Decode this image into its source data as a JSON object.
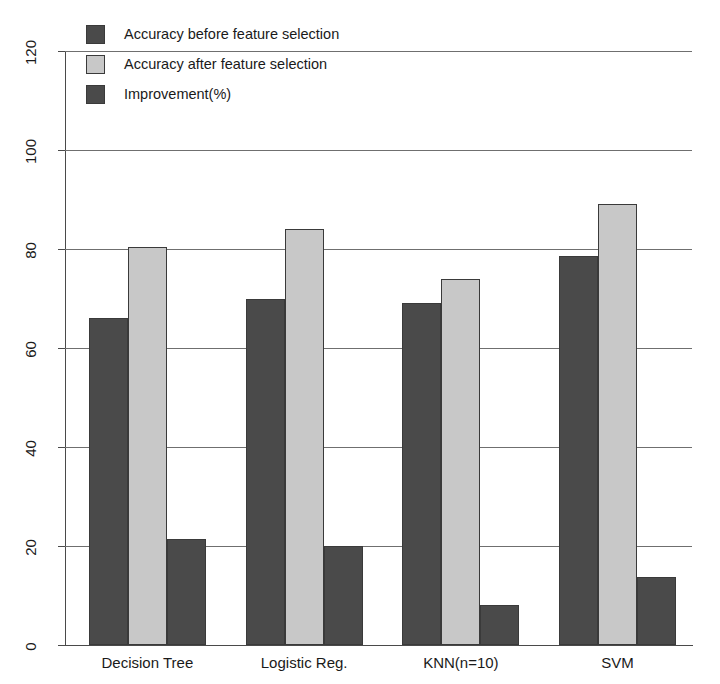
{
  "chart_data": {
    "type": "bar",
    "title": "",
    "xlabel": "",
    "ylabel": "",
    "ylim": [
      0,
      120
    ],
    "ytick_step": 20,
    "yticks": [
      0,
      20,
      40,
      60,
      80,
      100,
      120
    ],
    "ytick_labels": [
      "0",
      "20",
      "40",
      "60",
      "80",
      "100",
      "120"
    ],
    "grid": true,
    "grid_axis": "y",
    "legend_position": "top-left",
    "categories": [
      "Decision Tree",
      "Logistic Reg.",
      "KNN(n=10)",
      "SVM"
    ],
    "series": [
      {
        "name": "Accuracy before feature selection",
        "color": "#4a4a4a",
        "values": [
          66,
          70,
          69,
          78.5
        ]
      },
      {
        "name": "Accuracy after feature selection",
        "color": "#c8c8c8",
        "values": [
          80.5,
          84,
          74,
          89
        ]
      },
      {
        "name": "Improvement(%)",
        "color": "#4a4a4a",
        "values": [
          21.5,
          20,
          8,
          13.7
        ]
      }
    ]
  },
  "legend": {
    "items": [
      {
        "label": "Accuracy before feature selection",
        "swatch": "#4a4a4a"
      },
      {
        "label": "Accuracy after feature selection",
        "swatch": "#c8c8c8"
      },
      {
        "label": "Improvement(%)",
        "swatch": "#4a4a4a"
      }
    ]
  },
  "colors": {
    "series_dark": "#4a4a4a",
    "series_light": "#c8c8c8",
    "grid": "#6f6f6f",
    "axis": "#4a4a4a",
    "background": "#ffffff",
    "text": "#1a1a1a"
  }
}
